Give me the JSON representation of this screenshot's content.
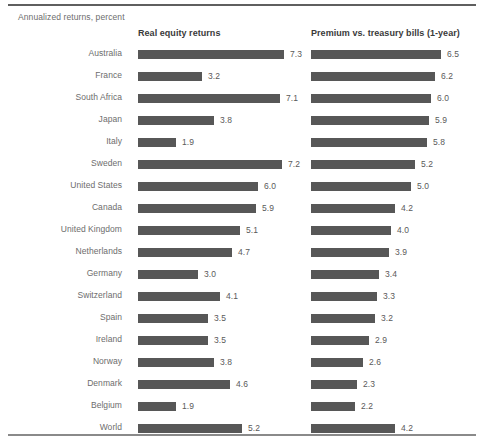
{
  "figure": {
    "subtitle": "Annualized returns, percent",
    "bar_color": "#575757",
    "text_color": "#6d6d6d",
    "rule_color": "#5f5f5f"
  },
  "columns": [
    {
      "key": "real_equity",
      "header": "Real equity returns"
    },
    {
      "key": "premium",
      "header": "Premium vs. treasury bills (1-year)"
    }
  ],
  "chart_data": {
    "type": "bar",
    "title": "",
    "subtitle": "Annualized returns, percent",
    "xlabel": "",
    "ylabel": "",
    "orientation": "horizontal",
    "grid": false,
    "legend": "none",
    "axis_visible": false,
    "value_labels": true,
    "xlim": [
      0,
      7.5
    ],
    "px_per_unit": 20,
    "categories": [
      "Australia",
      "France",
      "South Africa",
      "Japan",
      "Italy",
      "Sweden",
      "United States",
      "Canada",
      "United Kingdom",
      "Netherlands",
      "Germany",
      "Switzerland",
      "Spain",
      "Ireland",
      "Norway",
      "Denmark",
      "Belgium",
      "World"
    ],
    "series": [
      {
        "name": "Real equity returns",
        "values": [
          7.3,
          3.2,
          7.1,
          3.8,
          1.9,
          7.2,
          6.0,
          5.9,
          5.1,
          4.7,
          3.0,
          4.1,
          3.5,
          3.5,
          3.8,
          4.6,
          1.9,
          5.2
        ],
        "labels": [
          "7.3",
          "3.2",
          "7.1",
          "3.8",
          "1.9",
          "7.2",
          "6.0",
          "5.9",
          "5.1",
          "4.7",
          "3.0",
          "4.1",
          "3.5",
          "3.5",
          "3.8",
          "4.6",
          "1.9",
          "5.2"
        ]
      },
      {
        "name": "Premium vs. treasury bills (1-year)",
        "values": [
          6.5,
          6.2,
          6.0,
          5.9,
          5.8,
          5.2,
          5.0,
          4.2,
          4.0,
          3.9,
          3.4,
          3.3,
          3.2,
          2.9,
          2.6,
          2.3,
          2.2,
          4.2
        ],
        "labels": [
          "6.5",
          "6.2",
          "6.0",
          "5.9",
          "5.8",
          "5.2",
          "5.0",
          "4.2",
          "4.0",
          "3.9",
          "3.4",
          "3.3",
          "3.2",
          "2.9",
          "2.6",
          "2.3",
          "2.2",
          "4.2"
        ]
      }
    ]
  }
}
